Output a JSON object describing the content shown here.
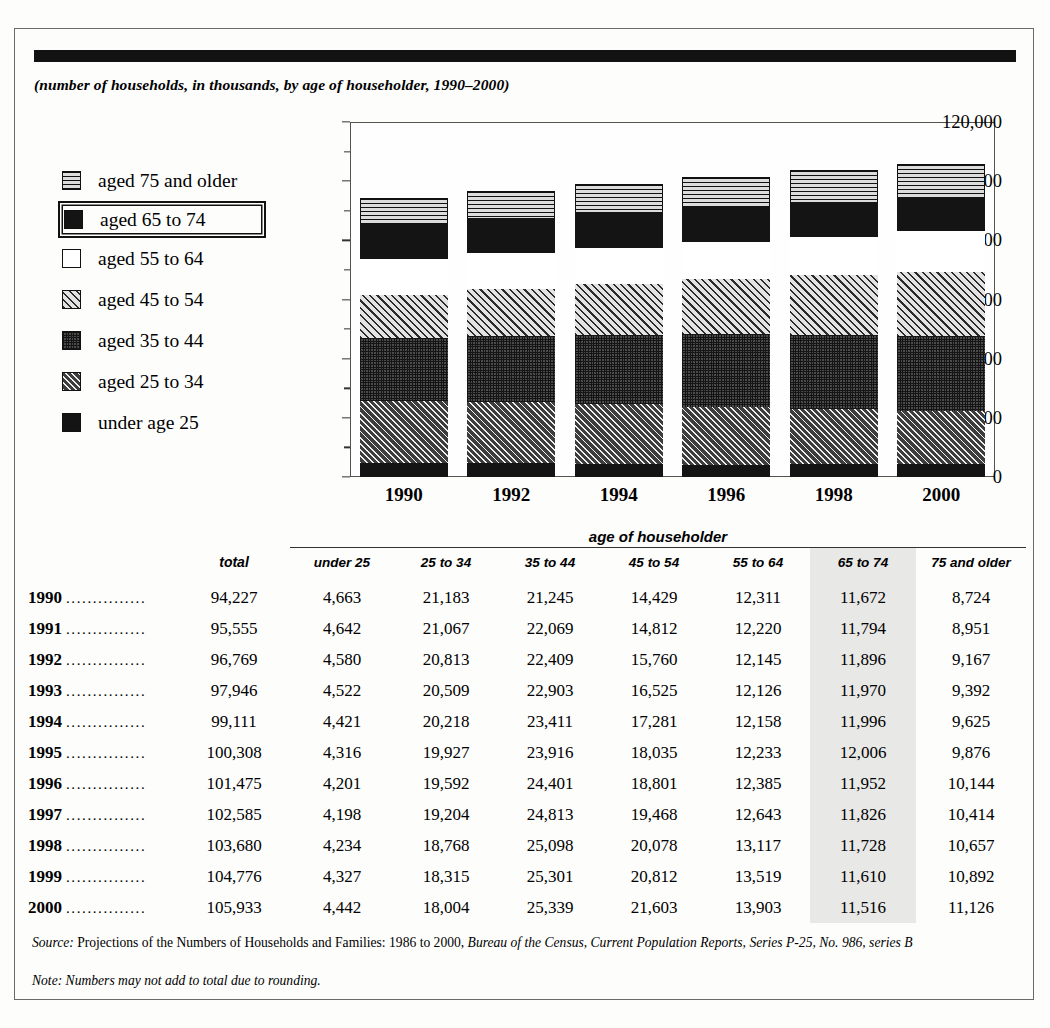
{
  "subtitle": "(number of households, in thousands, by age of householder, 1990–2000)",
  "legend": {
    "items": [
      {
        "label": "aged 75 and older",
        "pattern": "horizontal-lines",
        "highlighted": false
      },
      {
        "label": "aged 65 to 74",
        "pattern": "solid-black",
        "highlighted": true
      },
      {
        "label": "aged 55 to 64",
        "pattern": "white",
        "highlighted": false
      },
      {
        "label": "aged 45 to 54",
        "pattern": "light-diagonal-hatch",
        "highlighted": false
      },
      {
        "label": "aged 35 to 44",
        "pattern": "dark-grid",
        "highlighted": false
      },
      {
        "label": "aged 25 to 34",
        "pattern": "dark-diagonal-hatch",
        "highlighted": false
      },
      {
        "label": "under age 25",
        "pattern": "solid-black",
        "highlighted": false
      }
    ]
  },
  "chart_data": {
    "type": "bar",
    "stacked": true,
    "title": "",
    "subtitle": "(number of households, in thousands, by age of householder, 1990–2000)",
    "xlabel": "",
    "ylabel": "",
    "ylim": [
      0,
      120000
    ],
    "ytick_labels": [
      "0",
      "20,000",
      "40,000",
      "60,000",
      "80,000",
      "100,000",
      "120,000"
    ],
    "ytick_values": [
      0,
      20000,
      40000,
      60000,
      80000,
      100000,
      120000
    ],
    "minor_tick_step": 10000,
    "grid": false,
    "legend_position": "left",
    "categories": [
      "1990",
      "1992",
      "1994",
      "1996",
      "1998",
      "2000"
    ],
    "series": [
      {
        "name": "under age 25",
        "pattern": "solid-black",
        "values": [
          4663,
          4580,
          4421,
          4201,
          4234,
          4442
        ]
      },
      {
        "name": "aged 25 to 34",
        "pattern": "dark-diagonal-hatch",
        "values": [
          21183,
          20813,
          20218,
          19592,
          18768,
          18004
        ]
      },
      {
        "name": "aged 35 to 44",
        "pattern": "dark-grid",
        "values": [
          21245,
          22409,
          23411,
          24401,
          25098,
          25339
        ]
      },
      {
        "name": "aged 45 to 54",
        "pattern": "light-diagonal-hatch",
        "values": [
          14429,
          15760,
          17281,
          18801,
          20078,
          21603
        ]
      },
      {
        "name": "aged 55 to 64",
        "pattern": "white",
        "values": [
          12311,
          12145,
          12158,
          12385,
          13117,
          13903
        ]
      },
      {
        "name": "aged 65 to 74",
        "pattern": "solid-black",
        "values": [
          11672,
          11896,
          11996,
          11952,
          11728,
          11516
        ]
      },
      {
        "name": "aged 75 and older",
        "pattern": "horizontal-lines",
        "values": [
          8724,
          9167,
          9625,
          10144,
          10657,
          11126
        ]
      }
    ],
    "totals": [
      94227,
      96769,
      99111,
      101475,
      103680,
      105933
    ]
  },
  "table": {
    "group_header": "age of householder",
    "highlight_column": "65 to 74",
    "columns": [
      "total",
      "under 25",
      "25 to 34",
      "35 to 44",
      "45 to 54",
      "55 to 64",
      "65 to 74",
      "75 and older"
    ],
    "leader": "...............",
    "rows": [
      {
        "year": "1990",
        "values": [
          "94,227",
          "4,663",
          "21,183",
          "21,245",
          "14,429",
          "12,311",
          "11,672",
          "8,724"
        ]
      },
      {
        "year": "1991",
        "values": [
          "95,555",
          "4,642",
          "21,067",
          "22,069",
          "14,812",
          "12,220",
          "11,794",
          "8,951"
        ]
      },
      {
        "year": "1992",
        "values": [
          "96,769",
          "4,580",
          "20,813",
          "22,409",
          "15,760",
          "12,145",
          "11,896",
          "9,167"
        ]
      },
      {
        "year": "1993",
        "values": [
          "97,946",
          "4,522",
          "20,509",
          "22,903",
          "16,525",
          "12,126",
          "11,970",
          "9,392"
        ]
      },
      {
        "year": "1994",
        "values": [
          "99,111",
          "4,421",
          "20,218",
          "23,411",
          "17,281",
          "12,158",
          "11,996",
          "9,625"
        ]
      },
      {
        "year": "1995",
        "values": [
          "100,308",
          "4,316",
          "19,927",
          "23,916",
          "18,035",
          "12,233",
          "12,006",
          "9,876"
        ]
      },
      {
        "year": "1996",
        "values": [
          "101,475",
          "4,201",
          "19,592",
          "24,401",
          "18,801",
          "12,385",
          "11,952",
          "10,144"
        ]
      },
      {
        "year": "1997",
        "values": [
          "102,585",
          "4,198",
          "19,204",
          "24,813",
          "19,468",
          "12,643",
          "11,826",
          "10,414"
        ]
      },
      {
        "year": "1998",
        "values": [
          "103,680",
          "4,234",
          "18,768",
          "25,098",
          "20,078",
          "13,117",
          "11,728",
          "10,657"
        ]
      },
      {
        "year": "1999",
        "values": [
          "104,776",
          "4,327",
          "18,315",
          "25,301",
          "20,812",
          "13,519",
          "11,610",
          "10,892"
        ]
      },
      {
        "year": "2000",
        "values": [
          "105,933",
          "4,442",
          "18,004",
          "25,339",
          "21,603",
          "13,903",
          "11,516",
          "11,126"
        ]
      }
    ]
  },
  "footnotes": {
    "source_label": "Source:",
    "source_plain": " Projections of the Numbers of Households and Families: 1986 to 2000, ",
    "source_italic": "Bureau of the Census, Current Population Reports, Series P-25, No. 986, series B",
    "note_label": "Note:",
    "note_text": " Numbers may not add to total due to rounding."
  },
  "colors": {
    "ink": "#121212",
    "frame": "#6b6b68",
    "highlight": "#e8e8e6",
    "page": "#fdfdfc"
  }
}
